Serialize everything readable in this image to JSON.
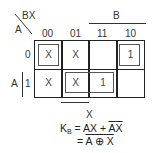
{
  "corner": {
    "row_var": "A",
    "col_var": "BX"
  },
  "column_headers": [
    "00",
    "01",
    "11",
    "10"
  ],
  "row_headers": [
    "0",
    "1"
  ],
  "group_labels": {
    "top": "B",
    "left": "A",
    "bottom": "X"
  },
  "cells": [
    [
      "X",
      "X",
      "",
      "1"
    ],
    [
      "X",
      "X",
      "1",
      ""
    ]
  ],
  "equation": {
    "lhs": "K",
    "lhs_sub": "B",
    "line1_eq": "=",
    "line1_t1": "AX",
    "line1_plus": "+",
    "line1_t2a": "A",
    "line1_t2b": "X",
    "line2_eq": "=",
    "line2_a": "A",
    "line2_op": "⊕",
    "line2_b": "X"
  }
}
